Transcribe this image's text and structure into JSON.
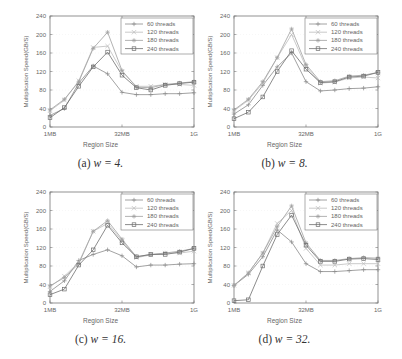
{
  "chart_data": [
    {
      "type": "line",
      "panel_label": "(a)",
      "caption": "(a) w = 4.",
      "caption_prefix": "(a)",
      "caption_math": "w = 4.",
      "title": "",
      "xlabel": "Region Size",
      "ylabel": "Multiplication Speed(GB/S)",
      "x": [
        "1MB",
        "2MB",
        "4MB",
        "8MB",
        "16MB",
        "32MB",
        "64MB",
        "128MB",
        "256MB",
        "512MB",
        "1G"
      ],
      "xticks": [
        "1MB",
        "32MB",
        "1G"
      ],
      "yticks": [
        0,
        40,
        80,
        120,
        160,
        200,
        240
      ],
      "ylim": [
        0,
        240
      ],
      "legend_position": "upper right",
      "series": [
        {
          "name": "60 threads",
          "marker": "plus",
          "values": [
            25,
            40,
            95,
            132,
            115,
            75,
            70,
            70,
            72,
            72,
            74
          ]
        },
        {
          "name": "120 threads",
          "marker": "x",
          "values": [
            35,
            58,
            100,
            172,
            175,
            120,
            88,
            88,
            92,
            92,
            90
          ]
        },
        {
          "name": "180 threads",
          "marker": "star",
          "values": [
            37,
            60,
            98,
            170,
            205,
            122,
            86,
            85,
            92,
            95,
            98
          ]
        },
        {
          "name": "240 threads",
          "marker": "square",
          "values": [
            20,
            42,
            88,
            130,
            162,
            112,
            85,
            80,
            90,
            94,
            97
          ]
        }
      ]
    },
    {
      "type": "line",
      "panel_label": "(b)",
      "caption": "(b) w = 8.",
      "caption_prefix": "(b)",
      "caption_math": "w = 8.",
      "title": "",
      "xlabel": "Region Size",
      "ylabel": "Multiplication Speed(GB/S)",
      "x": [
        "1MB",
        "2MB",
        "4MB",
        "8MB",
        "16MB",
        "32MB",
        "64MB",
        "128MB",
        "256MB",
        "512MB",
        "1G"
      ],
      "xticks": [
        "1MB",
        "32MB",
        "1G"
      ],
      "yticks": [
        0,
        40,
        80,
        120,
        160,
        200,
        240
      ],
      "ylim": [
        0,
        240
      ],
      "legend_position": "upper right",
      "series": [
        {
          "name": "60 threads",
          "marker": "plus",
          "values": [
            28,
            48,
            90,
            130,
            160,
            98,
            78,
            80,
            83,
            84,
            87
          ]
        },
        {
          "name": "120 threads",
          "marker": "x",
          "values": [
            35,
            58,
            95,
            150,
            200,
            130,
            95,
            97,
            106,
            108,
            106
          ]
        },
        {
          "name": "180 threads",
          "marker": "star",
          "values": [
            37,
            60,
            98,
            150,
            212,
            135,
            98,
            100,
            110,
            112,
            118
          ]
        },
        {
          "name": "240 threads",
          "marker": "square",
          "values": [
            18,
            32,
            65,
            120,
            165,
            125,
            96,
            98,
            108,
            110,
            118
          ]
        }
      ]
    },
    {
      "type": "line",
      "panel_label": "(c)",
      "caption": "(c) w = 16.",
      "caption_prefix": "(c)",
      "caption_math": "w = 16.",
      "title": "",
      "xlabel": "Region Size",
      "ylabel": "Multiplication Speed(GB/S)",
      "x": [
        "1MB",
        "2MB",
        "4MB",
        "8MB",
        "16MB",
        "32MB",
        "64MB",
        "128MB",
        "256MB",
        "512MB",
        "1G"
      ],
      "xticks": [
        "1MB",
        "32MB",
        "1G"
      ],
      "yticks": [
        0,
        40,
        80,
        120,
        160,
        200,
        240
      ],
      "ylim": [
        0,
        240
      ],
      "legend_position": "upper right",
      "series": [
        {
          "name": "60 threads",
          "marker": "plus",
          "values": [
            25,
            48,
            92,
            105,
            115,
            102,
            78,
            82,
            82,
            84,
            85
          ]
        },
        {
          "name": "120 threads",
          "marker": "x",
          "values": [
            35,
            58,
            88,
            155,
            172,
            135,
            98,
            104,
            108,
            108,
            112
          ]
        },
        {
          "name": "180 threads",
          "marker": "star",
          "values": [
            37,
            55,
            85,
            155,
            178,
            138,
            100,
            105,
            108,
            112,
            118
          ]
        },
        {
          "name": "240 threads",
          "marker": "square",
          "values": [
            18,
            30,
            82,
            115,
            168,
            130,
            100,
            105,
            105,
            110,
            118
          ]
        }
      ]
    },
    {
      "type": "line",
      "panel_label": "(d)",
      "caption": "(d) w = 32.",
      "caption_prefix": "(d)",
      "caption_math": "w = 32.",
      "title": "",
      "xlabel": "Region Size",
      "ylabel": "Multiplication Speed(GB/S)",
      "x": [
        "1MB",
        "2MB",
        "4MB",
        "8MB",
        "16MB",
        "32MB",
        "64MB",
        "128MB",
        "256MB",
        "512MB",
        "1G"
      ],
      "xticks": [
        "1MB",
        "32MB",
        "1G"
      ],
      "yticks": [
        0,
        40,
        80,
        120,
        160,
        200,
        240
      ],
      "ylim": [
        0,
        240
      ],
      "legend_position": "upper right",
      "series": [
        {
          "name": "60 threads",
          "marker": "plus",
          "values": [
            38,
            62,
            100,
            158,
            132,
            85,
            68,
            68,
            70,
            72,
            72
          ]
        },
        {
          "name": "120 threads",
          "marker": "x",
          "values": [
            38,
            65,
            108,
            172,
            200,
            118,
            82,
            82,
            85,
            85,
            85
          ]
        },
        {
          "name": "180 threads",
          "marker": "star",
          "values": [
            38,
            65,
            108,
            165,
            210,
            130,
            92,
            92,
            96,
            98,
            97
          ]
        },
        {
          "name": "240 threads",
          "marker": "square",
          "values": [
            5,
            7,
            80,
            148,
            190,
            125,
            90,
            90,
            95,
            96,
            94
          ]
        }
      ]
    }
  ],
  "colors": {
    "60 threads": "#8a8a8a",
    "120 threads": "#bdbdbd",
    "180 threads": "#a0a0a0",
    "240 threads": "#6e6e6e",
    "axis": "#777777",
    "grid": "#eeeeee",
    "text": "#666666"
  }
}
